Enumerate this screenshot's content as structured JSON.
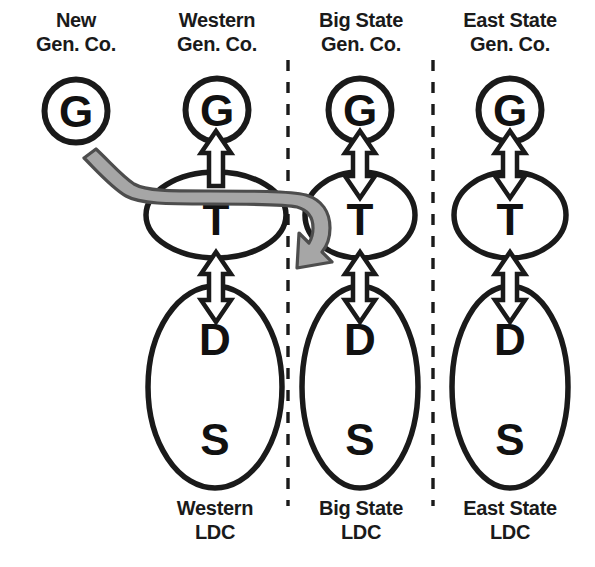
{
  "diagram": {
    "title_lines_note": "Column headers above, footers below",
    "colors": {
      "stroke": "#1a1a1a",
      "text": "#1a1a1a",
      "gray_arrow_fill": "#a6a6a6",
      "gray_arrow_stroke": "#4d4d4d",
      "white_arrow_fill": "#ffffff",
      "background": "#ffffff"
    },
    "columns": [
      {
        "id": "new-gen-co",
        "header": [
          "New",
          "Gen. Co."
        ],
        "footer": null,
        "nodes": [
          {
            "id": "g",
            "label": "G",
            "shape": "circle"
          }
        ]
      },
      {
        "id": "western",
        "header": [
          "Western",
          "Gen. Co."
        ],
        "footer": [
          "Western",
          "LDC"
        ],
        "nodes": [
          {
            "id": "g",
            "label": "G",
            "shape": "circle"
          },
          {
            "id": "t",
            "label": "T",
            "shape": "wide-ellipse"
          },
          {
            "id": "d",
            "label": "D",
            "shape": "tall-ellipse"
          },
          {
            "id": "s",
            "label": "S",
            "shape": "tall-ellipse"
          }
        ]
      },
      {
        "id": "big-state",
        "header": [
          "Big State",
          "Gen. Co."
        ],
        "footer": [
          "Big State",
          "LDC"
        ],
        "nodes": [
          {
            "id": "g",
            "label": "G",
            "shape": "circle"
          },
          {
            "id": "t",
            "label": "T",
            "shape": "wide-ellipse"
          },
          {
            "id": "d",
            "label": "D",
            "shape": "tall-ellipse"
          },
          {
            "id": "s",
            "label": "S",
            "shape": "tall-ellipse"
          }
        ]
      },
      {
        "id": "east-state",
        "header": [
          "East State",
          "Gen. Co."
        ],
        "footer": [
          "East State",
          "LDC"
        ],
        "nodes": [
          {
            "id": "g",
            "label": "G",
            "shape": "circle"
          },
          {
            "id": "t",
            "label": "T",
            "shape": "wide-ellipse"
          },
          {
            "id": "d",
            "label": "D",
            "shape": "tall-ellipse"
          },
          {
            "id": "s",
            "label": "S",
            "shape": "tall-ellipse"
          }
        ]
      }
    ],
    "labels": {
      "new_gen_co_line1": "New",
      "new_gen_co_line2": "Gen. Co.",
      "western_gen_co_line1": "Western",
      "western_gen_co_line2": "Gen. Co.",
      "big_state_gen_co_line1": "Big State",
      "big_state_gen_co_line2": "Gen. Co.",
      "east_state_gen_co_line1": "East State",
      "east_state_gen_co_line2": "Gen. Co.",
      "western_ldc_line1": "Western",
      "western_ldc_line2": "LDC",
      "big_state_ldc_line1": "Big State",
      "big_state_ldc_line2": "LDC",
      "east_state_ldc_line1": "East State",
      "east_state_ldc_line2": "LDC",
      "node_g": "G",
      "node_t": "T",
      "node_d": "D",
      "node_s": "S"
    },
    "connectors": [
      {
        "id": "western-g-t",
        "from": "western.g",
        "to": "western.t",
        "style": "white-block-arrow",
        "heads": "up"
      },
      {
        "id": "western-t-d",
        "from": "western.t",
        "to": "western.d",
        "style": "white-block-arrow",
        "heads": "both"
      },
      {
        "id": "big-state-g-t",
        "from": "big-state.g",
        "to": "big-state.t",
        "style": "white-block-arrow",
        "heads": "both"
      },
      {
        "id": "big-state-t-d",
        "from": "big-state.t",
        "to": "big-state.d",
        "style": "white-block-arrow",
        "heads": "both"
      },
      {
        "id": "east-state-g-t",
        "from": "east-state.g",
        "to": "east-state.t",
        "style": "white-block-arrow",
        "heads": "both"
      },
      {
        "id": "east-state-t-d",
        "from": "east-state.t",
        "to": "east-state.d",
        "style": "white-block-arrow",
        "heads": "both"
      },
      {
        "id": "new-gen-to-big-state-t",
        "from": "new-gen-co.g",
        "to": "big-state.t",
        "style": "gray-curved-arrow",
        "heads": "end"
      }
    ],
    "dividers": [
      {
        "id": "divider-1",
        "x": 288,
        "style": "dashed-vertical"
      },
      {
        "id": "divider-2",
        "x": 433,
        "style": "dashed-vertical"
      }
    ]
  }
}
